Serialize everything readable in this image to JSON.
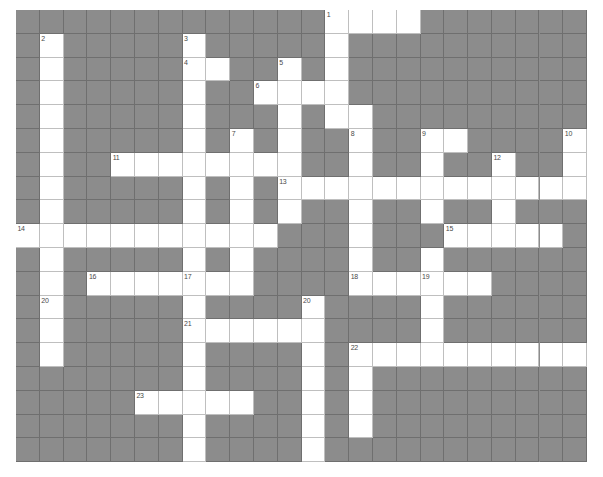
{
  "puzzle": {
    "title": "Crossword Grid",
    "rows": 19,
    "cols": 24,
    "cell_size_px": 23.8,
    "colors": {
      "block_fill": "#8c8c8c",
      "open_fill": "#ffffff",
      "grid_line": "#6f6f6f",
      "open_grid_line": "#bfbfbf",
      "number_text": "#4a4a4a",
      "page_background": "#ffffff"
    },
    "clue_numbers_visible": [
      1,
      2,
      3,
      4,
      5,
      6,
      7,
      8,
      9,
      10,
      11,
      12,
      13,
      14,
      15,
      16,
      17,
      18,
      19,
      20,
      20,
      21,
      22,
      23
    ],
    "numbered_cells": [
      {
        "number": "1",
        "row": 0,
        "col": 13
      },
      {
        "number": "2",
        "row": 1,
        "col": 1
      },
      {
        "number": "3",
        "row": 1,
        "col": 7
      },
      {
        "number": "4",
        "row": 2,
        "col": 7
      },
      {
        "number": "5",
        "row": 2,
        "col": 11
      },
      {
        "number": "6",
        "row": 3,
        "col": 10
      },
      {
        "number": "7",
        "row": 5,
        "col": 9
      },
      {
        "number": "8",
        "row": 5,
        "col": 14
      },
      {
        "number": "9",
        "row": 5,
        "col": 17
      },
      {
        "number": "10",
        "row": 5,
        "col": 23
      },
      {
        "number": "11",
        "row": 6,
        "col": 4
      },
      {
        "number": "12",
        "row": 6,
        "col": 20
      },
      {
        "number": "13",
        "row": 7,
        "col": 11
      },
      {
        "number": "14",
        "row": 9,
        "col": 0
      },
      {
        "number": "15",
        "row": 9,
        "col": 18
      },
      {
        "number": "16",
        "row": 11,
        "col": 3
      },
      {
        "number": "17",
        "row": 11,
        "col": 7
      },
      {
        "number": "18",
        "row": 11,
        "col": 14
      },
      {
        "number": "19",
        "row": 11,
        "col": 17
      },
      {
        "number": "20",
        "row": 12,
        "col": 1
      },
      {
        "number": "20",
        "row": 12,
        "col": 12
      },
      {
        "number": "21",
        "row": 13,
        "col": 7
      },
      {
        "number": "22",
        "row": 14,
        "col": 14
      },
      {
        "number": "23",
        "row": 16,
        "col": 5
      }
    ],
    "open_cells_by_row": [
      [
        13,
        14,
        15,
        16
      ],
      [
        1,
        7,
        13
      ],
      [
        1,
        7,
        8,
        11,
        13
      ],
      [
        1,
        7,
        10,
        11,
        12,
        13
      ],
      [
        1,
        7,
        11,
        13,
        14
      ],
      [
        1,
        7,
        9,
        11,
        14,
        17,
        18,
        23
      ],
      [
        1,
        4,
        5,
        6,
        7,
        8,
        9,
        10,
        11,
        14,
        17,
        20,
        23
      ],
      [
        1,
        7,
        9,
        11,
        12,
        13,
        14,
        15,
        16,
        17,
        18,
        19,
        20,
        21,
        22,
        23
      ],
      [
        1,
        7,
        9,
        11,
        14,
        17,
        20
      ],
      [
        0,
        1,
        2,
        3,
        4,
        5,
        6,
        7,
        8,
        9,
        10,
        14,
        18,
        19,
        20,
        21,
        22
      ],
      [
        1,
        7,
        9,
        14,
        17
      ],
      [
        1,
        3,
        4,
        5,
        6,
        7,
        8,
        9,
        14,
        15,
        16,
        17,
        18,
        19
      ],
      [
        1,
        7,
        12,
        17
      ],
      [
        1,
        7,
        8,
        9,
        10,
        11,
        12,
        17
      ],
      [
        1,
        7,
        12,
        14,
        15,
        16,
        17,
        18,
        19,
        20,
        21,
        22,
        23
      ],
      [
        7,
        12,
        14
      ],
      [
        5,
        6,
        7,
        8,
        9,
        12,
        14
      ],
      [
        7,
        12,
        14
      ],
      [
        7,
        12
      ]
    ]
  }
}
